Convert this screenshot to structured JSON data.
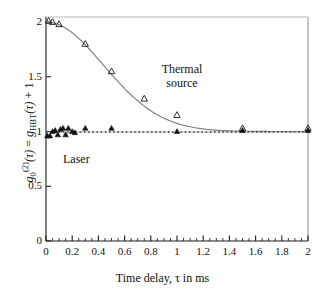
{
  "chart_data": {
    "type": "scatter",
    "title": "",
    "xlabel": "Time delay, τ in ms",
    "ylabel": "g₀(2)(τ) = gHBT(τ) + 1",
    "xlim": [
      0,
      2
    ],
    "ylim": [
      0,
      2.1
    ],
    "grid": false,
    "legend_position": "inline-annotations",
    "x_ticks": [
      0,
      0.2,
      0.4,
      0.6,
      0.8,
      1,
      1.2,
      1.4,
      1.6,
      1.8,
      2
    ],
    "x_tick_labels": [
      "0",
      "0.2",
      "0.4",
      "0.6",
      "0.8",
      "1",
      "1.2",
      "1.4",
      "1.6",
      "1.8",
      "2"
    ],
    "x_minor_tick_step": 0.05,
    "y_ticks": [
      0,
      0.5,
      1,
      1.5,
      2
    ],
    "y_tick_labels": [
      "0",
      "0.5",
      "1",
      "1.5",
      "2"
    ],
    "series": [
      {
        "name": "Thermal source",
        "marker": "open-triangle",
        "color": "#1a1a1a",
        "points": [
          {
            "x": 0.02,
            "y": 2.01
          },
          {
            "x": 0.05,
            "y": 2.0
          },
          {
            "x": 0.1,
            "y": 1.98
          },
          {
            "x": 0.3,
            "y": 1.8
          },
          {
            "x": 0.5,
            "y": 1.55
          },
          {
            "x": 0.75,
            "y": 1.3
          },
          {
            "x": 1.0,
            "y": 1.15
          },
          {
            "x": 1.5,
            "y": 1.03
          },
          {
            "x": 2.0,
            "y": 1.03
          }
        ]
      },
      {
        "name": "Laser",
        "marker": "filled-triangle",
        "color": "#1a1a1a",
        "points": [
          {
            "x": 0.01,
            "y": 0.96
          },
          {
            "x": 0.03,
            "y": 0.96
          },
          {
            "x": 0.05,
            "y": 1.0
          },
          {
            "x": 0.07,
            "y": 1.01
          },
          {
            "x": 0.09,
            "y": 0.97
          },
          {
            "x": 0.11,
            "y": 1.02
          },
          {
            "x": 0.13,
            "y": 1.03
          },
          {
            "x": 0.15,
            "y": 0.97
          },
          {
            "x": 0.17,
            "y": 1.03
          },
          {
            "x": 0.2,
            "y": 1.0
          },
          {
            "x": 0.22,
            "y": 0.99
          },
          {
            "x": 0.3,
            "y": 1.03
          },
          {
            "x": 0.5,
            "y": 1.03
          },
          {
            "x": 1.0,
            "y": 1.0
          },
          {
            "x": 1.5,
            "y": 1.01
          },
          {
            "x": 2.0,
            "y": 1.01
          }
        ]
      }
    ],
    "fits": [
      {
        "name": "thermal-fit-curve",
        "style": "solid",
        "description": "Gaussian decay from 2 to 1 with coherence time ~0.6 ms"
      },
      {
        "name": "laser-fit-line",
        "style": "dotted",
        "description": "Flat line at g2 = 1"
      }
    ],
    "annotations": [
      {
        "name": "thermal-source",
        "text_line_1": "Thermal",
        "text_line_2": "source"
      },
      {
        "name": "laser",
        "text": "Laser"
      }
    ]
  },
  "axis": {
    "x_title": "Time delay, τ in ms",
    "x_tick_labels": [
      "0",
      "0.2",
      "0.4",
      "0.6",
      "0.8",
      "1",
      "1.2",
      "1.4",
      "1.6",
      "1.8",
      "2"
    ],
    "y_tick_labels": [
      "0",
      "0.5",
      "1",
      "1.5",
      "2"
    ]
  },
  "annotations": {
    "thermal_line1": "Thermal",
    "thermal_line2": "source",
    "laser": "Laser"
  }
}
